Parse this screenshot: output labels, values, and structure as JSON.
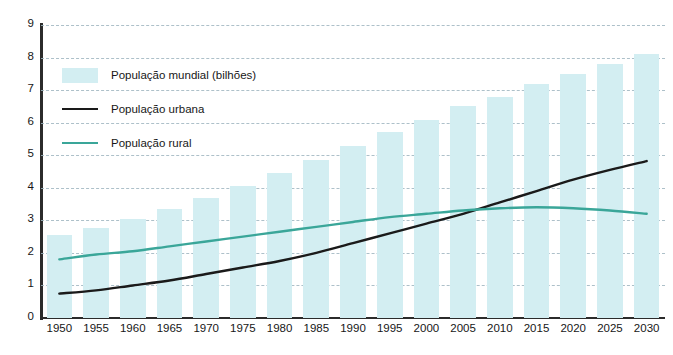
{
  "chart_data": {
    "type": "bar",
    "title": "",
    "subtitle": "",
    "xlabel": "",
    "ylabel": "",
    "categories": [
      "1950",
      "1955",
      "1960",
      "1965",
      "1970",
      "1975",
      "1980",
      "1985",
      "1990",
      "1995",
      "2000",
      "2005",
      "2010",
      "2015",
      "2020",
      "2025",
      "2030"
    ],
    "ylim": [
      0,
      9
    ],
    "ytick_values": [
      0,
      1,
      2,
      3,
      4,
      5,
      6,
      7,
      8,
      9
    ],
    "ytick_labels": [
      "0",
      "1",
      "2",
      "3",
      "4",
      "5",
      "6",
      "7",
      "8",
      "9"
    ],
    "grid": "horizontal-dashed",
    "legend_position": "upper-left-inside",
    "series": [
      {
        "name": "População mundial (bilhões)",
        "type": "bar",
        "color": "#d3eef2",
        "values": [
          2.55,
          2.78,
          3.03,
          3.35,
          3.7,
          4.07,
          4.44,
          4.85,
          5.27,
          5.7,
          6.08,
          6.5,
          6.8,
          7.2,
          7.5,
          7.8,
          8.1
        ]
      },
      {
        "name": "População urbana",
        "type": "line",
        "color": "#1a1a1a",
        "values": [
          0.75,
          0.85,
          1.0,
          1.15,
          1.35,
          1.55,
          1.75,
          2.0,
          2.3,
          2.6,
          2.9,
          3.2,
          3.55,
          3.9,
          4.25,
          4.55,
          4.82
        ]
      },
      {
        "name": "População rural",
        "type": "line",
        "color": "#3aa699",
        "values": [
          1.8,
          1.95,
          2.05,
          2.2,
          2.35,
          2.5,
          2.65,
          2.8,
          2.95,
          3.1,
          3.2,
          3.3,
          3.37,
          3.4,
          3.37,
          3.3,
          3.2
        ]
      }
    ],
    "annotations": []
  },
  "legend": {
    "items": [
      {
        "label": "População mundial (bilhões)",
        "key": "swatch",
        "color": "#d3eef2"
      },
      {
        "label": "População urbana",
        "key": "line",
        "color": "#1a1a1a"
      },
      {
        "label": "População rural",
        "key": "line",
        "color": "#3aa699"
      }
    ]
  },
  "colors": {
    "bar": "#d3eef2",
    "urban_line": "#1a1a1a",
    "rural_line": "#3aa699",
    "axis": "#2b2b2b",
    "grid": "#9fb6c0",
    "background": "#ffffff",
    "text": "#171717"
  }
}
